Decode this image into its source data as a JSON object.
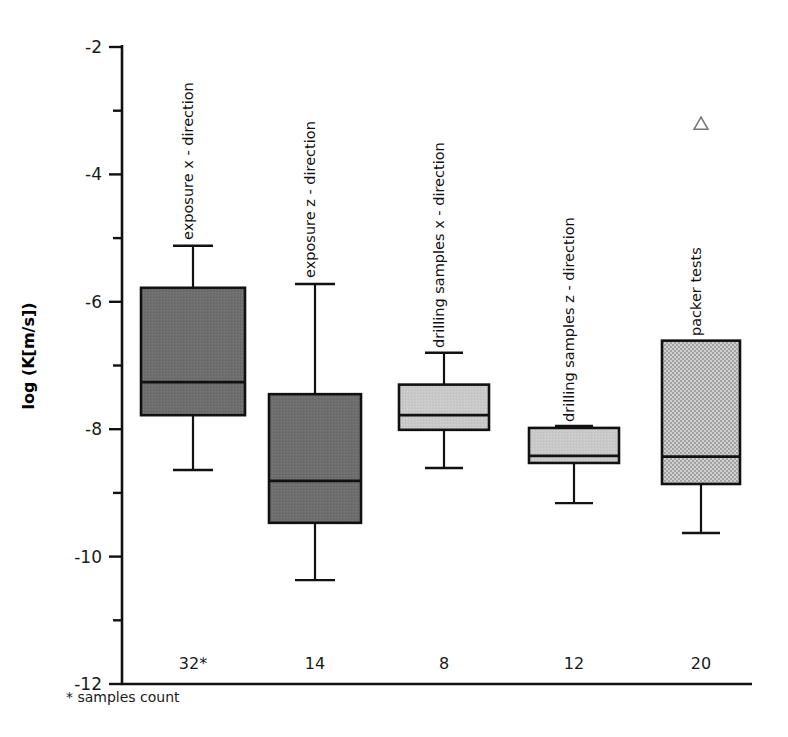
{
  "chart_data": {
    "type": "box",
    "title": "",
    "xlabel": "",
    "ylabel": "log (K[m/s])",
    "ylim": [
      -12,
      -2
    ],
    "y_ticks_major": [
      -2,
      -4,
      -6,
      -8,
      -10,
      -12
    ],
    "y_ticks_major_labels": [
      "-2",
      "-4",
      "-6",
      "-8",
      "-10",
      "-12"
    ],
    "y_ticks_minor": [
      -3,
      -5,
      -7,
      -9,
      -11
    ],
    "grid": false,
    "legend": "none",
    "footnote": "* samples count",
    "categories": [
      "exposure x - direction",
      "exposure z - direction",
      "drilling samples x - direction",
      "drilling samples z - direction",
      "packer tests"
    ],
    "sample_counts": [
      "32*",
      "14",
      "8",
      "12",
      "20"
    ],
    "boxes": [
      {
        "name": "exposure x - direction",
        "count": "32*",
        "whisker_high": -5.12,
        "q3": -5.78,
        "median": -7.26,
        "q1": -7.78,
        "whisker_low": -8.64,
        "fill": "#6e6e6e",
        "outliers": []
      },
      {
        "name": "exposure z - direction",
        "count": "14",
        "whisker_high": -5.72,
        "q3": -7.45,
        "median": -8.81,
        "q1": -9.47,
        "whisker_low": -10.37,
        "fill": "#6e6e6e",
        "outliers": []
      },
      {
        "name": "drilling samples x - direction",
        "count": "8",
        "whisker_high": -6.8,
        "q3": -7.3,
        "median": -7.78,
        "q1": -8.01,
        "whisker_low": -8.61,
        "fill": "#c9c9c9",
        "outliers": []
      },
      {
        "name": "drilling samples z - direction",
        "count": "12",
        "whisker_high": -7.95,
        "q3": -7.98,
        "median": -8.42,
        "q1": -8.53,
        "whisker_low": -9.16,
        "fill": "#c9c9c9",
        "outliers": []
      },
      {
        "name": "packer tests",
        "count": "20",
        "whisker_high": -6.61,
        "q3": -6.61,
        "median": -8.43,
        "q1": -8.86,
        "whisker_low": -9.63,
        "fill": "#b9b9b9",
        "outliers": [
          -3.21
        ]
      }
    ]
  },
  "colors": {
    "axis": "#111111",
    "dark_box": "#6e6e6e",
    "light_box": "#c9c9c9",
    "hatch_box": "#b9b9b9",
    "outlier_stroke": "#777777",
    "background": "#ffffff"
  }
}
